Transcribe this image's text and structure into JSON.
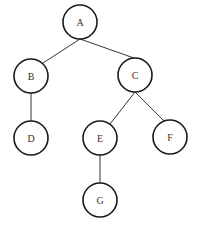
{
  "diagram": {
    "type": "tree",
    "nodes": [
      {
        "id": "A",
        "label": "A",
        "cx": 80,
        "cy": 22,
        "r": 17
      },
      {
        "id": "B",
        "label": "B",
        "cx": 31,
        "cy": 76,
        "r": 17
      },
      {
        "id": "C",
        "label": "C",
        "cx": 135,
        "cy": 75,
        "r": 17
      },
      {
        "id": "D",
        "label": "D",
        "cx": 31,
        "cy": 138,
        "r": 17
      },
      {
        "id": "E",
        "label": "E",
        "cx": 100,
        "cy": 138,
        "r": 17
      },
      {
        "id": "F",
        "label": "F",
        "cx": 170,
        "cy": 137,
        "r": 17
      },
      {
        "id": "G",
        "label": "G",
        "cx": 100,
        "cy": 200,
        "r": 17
      }
    ],
    "edges": [
      {
        "from": "A",
        "to": "B",
        "x1": 80,
        "y1": 39,
        "x2": 43,
        "y2": 63
      },
      {
        "from": "A",
        "to": "C",
        "x1": 80,
        "y1": 39,
        "x2": 134,
        "y2": 58
      },
      {
        "from": "B",
        "to": "D",
        "x1": 31,
        "y1": 93,
        "x2": 31,
        "y2": 121
      },
      {
        "from": "C",
        "to": "E",
        "x1": 135,
        "y1": 92,
        "x2": 110,
        "y2": 124
      },
      {
        "from": "C",
        "to": "F",
        "x1": 135,
        "y1": 92,
        "x2": 164,
        "y2": 121
      },
      {
        "from": "E",
        "to": "G",
        "x1": 100,
        "y1": 155,
        "x2": 100,
        "y2": 183
      }
    ]
  }
}
